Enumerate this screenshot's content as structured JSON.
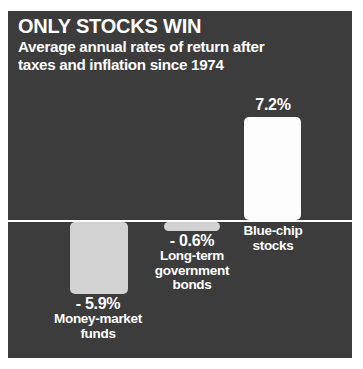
{
  "chart_data": {
    "type": "bar",
    "title": "ONLY STOCKS WIN",
    "subtitle_line1": "Average annual rates of return after",
    "subtitle_line2": "taxes and inflation since 1974",
    "xlabel": "",
    "ylabel": "",
    "ylim": [
      -7,
      9
    ],
    "grid": false,
    "legend": "none",
    "orientation": "vertical",
    "baseline": 0,
    "categories": [
      "Money-market funds",
      "Long-term government bonds",
      "Blue-chip stocks"
    ],
    "values": [
      -5.9,
      -0.6,
      7.2
    ],
    "value_labels": [
      "- 5.9%",
      "- 0.6%",
      "7.2%"
    ],
    "bar_colors": [
      "#d2d2d2",
      "#d2d2d2",
      "#fdfdfd"
    ],
    "background_color": "#3c3c3c",
    "text_color": "#ffffff",
    "baseline_color": "#ffffff"
  },
  "bars": [
    {
      "value_label": "- 5.9%",
      "cat_line1": "Money-market",
      "cat_line2": "funds"
    },
    {
      "value_label": "- 0.6%",
      "cat_line1": "Long-term",
      "cat_line2": "government",
      "cat_line3": "bonds"
    },
    {
      "value_label": "7.2%",
      "cat_line1": "Blue-chip",
      "cat_line2": "stocks"
    }
  ]
}
